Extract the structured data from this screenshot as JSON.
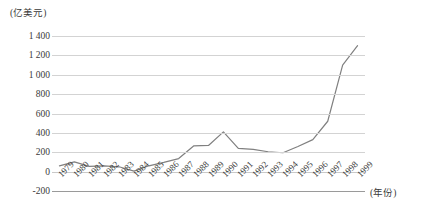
{
  "chart_data": {
    "type": "line",
    "title": "",
    "subtitle": "",
    "xlabel": "(年份)",
    "ylabel": "(亿美元)",
    "ylim": [
      -200,
      1400
    ],
    "ytick_step": 200,
    "grid": true,
    "legend": false,
    "legend_position": "none",
    "line_color": "#808080",
    "grid_color": "#d3d3d3",
    "axis_color": "#9a9a9a",
    "categories": [
      "1979",
      "1980",
      "1981",
      "1982",
      "1983",
      "1984",
      "1985",
      "1986",
      "1987",
      "1988",
      "1989",
      "1990",
      "1991",
      "1992",
      "1993",
      "1994",
      "1995",
      "1996",
      "1997",
      "1998",
      "1999"
    ],
    "ytick_labels": [
      "1 400",
      "1 200",
      "1 000",
      "800",
      "600",
      "400",
      "200",
      "0",
      "-200"
    ],
    "ytick_values": [
      1400,
      1200,
      1000,
      800,
      600,
      400,
      200,
      0,
      -200
    ],
    "series": [
      {
        "name": "",
        "values": [
          60,
          100,
          55,
          60,
          50,
          5,
          60,
          95,
          135,
          265,
          270,
          410,
          240,
          230,
          205,
          195,
          260,
          330,
          520,
          1100,
          1300
        ]
      }
    ]
  }
}
